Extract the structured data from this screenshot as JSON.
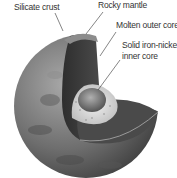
{
  "diagram": {
    "labels": {
      "crust": "Silicate crust",
      "mantle": "Rocky mantle",
      "outer_core": "Molten outer core",
      "inner_core_line1": "Solid iron-nickel",
      "inner_core_line2": "inner core"
    },
    "colors": {
      "surface": "#7a7a7a",
      "mantle_cut": "#3a3a3a",
      "outer_core": "#d8d8d8",
      "inner_core": "#8a8a8a",
      "text": "#333333"
    }
  }
}
